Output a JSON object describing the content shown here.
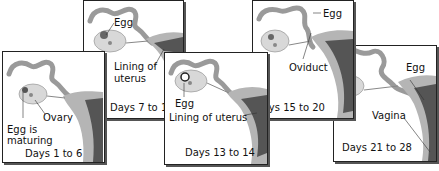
{
  "panels": [
    {
      "id": "p1",
      "days": "Days 1 to 6",
      "labels": {
        "egg": "Egg is",
        "egg2": "maturing",
        "ovary": "Ovary"
      }
    },
    {
      "id": "p2",
      "days": "Days 7 to 12",
      "labels": {
        "egg": "Egg",
        "lining": "Lining of",
        "lining2": "uterus"
      }
    },
    {
      "id": "p3",
      "days": "Days 13 to 14",
      "labels": {
        "egg": "Egg",
        "lining": "Lining of uterus"
      }
    },
    {
      "id": "p4",
      "days": "Days 15 to 20",
      "labels": {
        "egg": "Egg",
        "oviduct": "Oviduct"
      }
    },
    {
      "id": "p5",
      "days": "Days 21 to 28",
      "labels": {
        "egg": "Egg",
        "vagina": "Vagina"
      }
    }
  ],
  "colors": {
    "oviduct": "#9a9a9a",
    "uterus": "#b5b5b5",
    "lining": "#555555",
    "ovary": "#d8d8d8",
    "border": "#222222"
  }
}
